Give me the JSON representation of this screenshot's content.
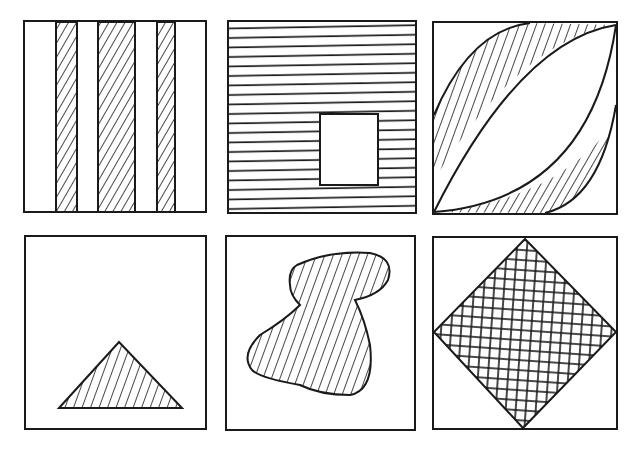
{
  "figure": {
    "ink_color": "#1a1a1a",
    "background_color": "#ffffff",
    "panels": [
      {
        "id": "vertical-stripes",
        "label": "Three vertical hatched stripes",
        "hatch": "diagonal"
      },
      {
        "id": "horizontal-lines-with-window",
        "label": "Horizontal line fill with white square",
        "hatch": "horizontal"
      },
      {
        "id": "lens-crescents",
        "label": "Two hatched crescents around a lens shape",
        "hatch": "diagonal"
      },
      {
        "id": "triangle",
        "label": "Hatched triangle",
        "hatch": "diagonal"
      },
      {
        "id": "blob",
        "label": "Hatched irregular blob",
        "hatch": "diagonal"
      },
      {
        "id": "diamond",
        "label": "Cross-hatched diamond",
        "hatch": "cross"
      }
    ]
  }
}
